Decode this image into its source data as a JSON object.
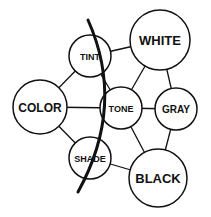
{
  "diagram": {
    "nodes": [
      {
        "id": "tint",
        "label": "TINT",
        "cx": 90,
        "cy": 56,
        "r": 21,
        "font": 9
      },
      {
        "id": "white",
        "label": "WHITE",
        "cx": 160,
        "cy": 40,
        "r": 30,
        "font": 13
      },
      {
        "id": "color",
        "label": "COLOR",
        "cx": 40,
        "cy": 107,
        "r": 27,
        "font": 12
      },
      {
        "id": "tone",
        "label": "TONE",
        "cx": 121,
        "cy": 108,
        "r": 21,
        "font": 9
      },
      {
        "id": "gray",
        "label": "GRAY",
        "cx": 176,
        "cy": 109,
        "r": 21,
        "font": 10
      },
      {
        "id": "shade",
        "label": "SHADE",
        "cx": 90,
        "cy": 158,
        "r": 21,
        "font": 9
      },
      {
        "id": "black",
        "label": "BLACK",
        "cx": 158,
        "cy": 178,
        "r": 29,
        "font": 13
      }
    ],
    "edges": [
      [
        "color",
        "tint"
      ],
      [
        "color",
        "tone"
      ],
      [
        "color",
        "shade"
      ],
      [
        "tint",
        "white"
      ],
      [
        "tint",
        "tone"
      ],
      [
        "white",
        "tone"
      ],
      [
        "white",
        "gray"
      ],
      [
        "tone",
        "gray"
      ],
      [
        "tone",
        "black"
      ],
      [
        "gray",
        "black"
      ],
      [
        "shade",
        "black"
      ]
    ],
    "divider_arc": {
      "path": "M88,20 Q126,105 78,192"
    },
    "colors": {
      "stroke": "#111111",
      "background": "#ffffff"
    }
  }
}
